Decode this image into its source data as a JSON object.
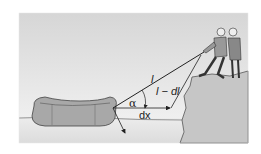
{
  "figure": {
    "labels": {
      "rope_length": "l",
      "shortened_rope": "l − dl",
      "angle": "α",
      "displacement": "dx"
    },
    "colors": {
      "sky_top": "#d8d8d8",
      "sky_bottom": "#f4f4f4",
      "cliff": "#c4c4c4",
      "water": "#e2e2e2",
      "raft": "#a9a9a9",
      "line": "#222222"
    }
  }
}
